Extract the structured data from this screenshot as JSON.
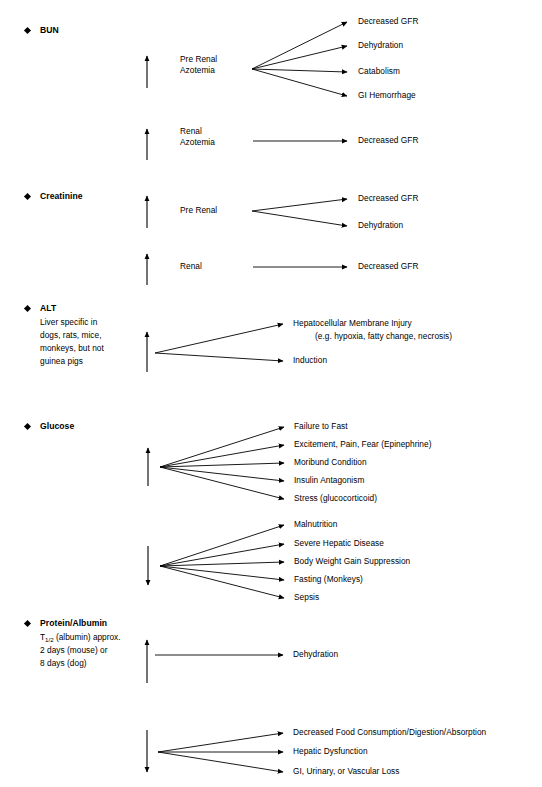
{
  "document": {
    "title": "Clinical Pathology Parameter Change Causes",
    "bullet_icon": "diamond-bullet",
    "up_arrow_icon": "arrow-up-icon",
    "down_arrow_icon": "arrow-down-icon",
    "connector_icon": "arrow-right-connector",
    "ink_color": "#000000",
    "background_color": "#ffffff"
  },
  "sections": [
    {
      "id": "bun",
      "label": "BUN",
      "note_lines": [],
      "groups": [
        {
          "id": "bun-prerenal",
          "direction": "up",
          "mediator_lines": [
            "Pre Renal",
            "Azotemia"
          ],
          "causes": [
            "Decreased GFR",
            "Dehydration",
            "Catabolism",
            "GI Hemorrhage"
          ]
        },
        {
          "id": "bun-renal",
          "direction": "up",
          "mediator_lines": [
            "Renal",
            "Azotemia"
          ],
          "causes": [
            "Decreased GFR"
          ]
        }
      ]
    },
    {
      "id": "creatinine",
      "label": "Creatinine",
      "note_lines": [],
      "groups": [
        {
          "id": "creatinine-prerenal",
          "direction": "up",
          "mediator_lines": [
            "Pre Renal"
          ],
          "causes": [
            "Decreased GFR",
            "Dehydration"
          ]
        },
        {
          "id": "creatinine-renal",
          "direction": "up",
          "mediator_lines": [
            "Renal"
          ],
          "causes": [
            "Decreased GFR"
          ]
        }
      ]
    },
    {
      "id": "alt",
      "label": "ALT",
      "note_lines": [
        "Liver specific in",
        "dogs, rats, mice,",
        "monkeys, but not",
        "guinea pigs"
      ],
      "groups": [
        {
          "id": "alt-increase",
          "direction": "up",
          "mediator_lines": [],
          "causes": [
            "Hepatocellular Membrane Injury",
            "Induction"
          ],
          "sub_causes": [
            "(e.g. hypoxia, fatty change, necrosis)"
          ]
        }
      ]
    },
    {
      "id": "glucose",
      "label": "Glucose",
      "note_lines": [],
      "groups": [
        {
          "id": "glucose-increase",
          "direction": "up",
          "mediator_lines": [],
          "causes": [
            "Failure to Fast",
            "Excitement, Pain, Fear (Epinephrine)",
            "Moribund Condition",
            "Insulin Antagonism",
            "Stress (glucocorticoid)"
          ]
        },
        {
          "id": "glucose-decrease",
          "direction": "down",
          "mediator_lines": [],
          "causes": [
            "Malnutrition",
            "Severe Hepatic Disease",
            "Body Weight Gain Suppression",
            "Fasting (Monkeys)",
            "Sepsis"
          ]
        }
      ]
    },
    {
      "id": "protein-albumin",
      "label": "Protein/Albumin",
      "note_lines": [
        "T1/2 (albumin) approx.",
        "2 days (mouse) or",
        "8 days (dog)"
      ],
      "groups": [
        {
          "id": "protein-increase",
          "direction": "up",
          "mediator_lines": [],
          "causes": [
            "Dehydration"
          ]
        },
        {
          "id": "protein-decrease",
          "direction": "down",
          "mediator_lines": [],
          "causes": [
            "Decreased Food Consumption/Digestion/Absorption",
            "Hepatic Dysfunction",
            "GI, Urinary, or Vascular Loss"
          ]
        }
      ]
    }
  ],
  "labels": {
    "bun_heading": "BUN",
    "creatinine_heading": "Creatinine",
    "alt_heading": "ALT",
    "glucose_heading": "Glucose",
    "protein_heading": "Protein/Albumin",
    "alt_note_1": "Liver specific in",
    "alt_note_2": "dogs, rats, mice,",
    "alt_note_3": "monkeys, but not",
    "alt_note_4": "guinea pigs",
    "protein_note_1_pre": "T",
    "protein_note_1_sub": "1/2",
    "protein_note_1_post": " (albumin) approx.",
    "protein_note_2": "2 days (mouse) or",
    "protein_note_3": "8 days (dog)",
    "bun_prerenal_1": "Pre Renal",
    "bun_prerenal_2": "Azotemia",
    "bun_renal_1": "Renal",
    "bun_renal_2": "Azotemia",
    "creat_prerenal": "Pre Renal",
    "creat_renal": "Renal",
    "bun_cause_1": "Decreased GFR",
    "bun_cause_2": "Dehydration",
    "bun_cause_3": "Catabolism",
    "bun_cause_4": "GI Hemorrhage",
    "bun_renal_cause_1": "Decreased GFR",
    "creat_prerenal_cause_1": "Decreased GFR",
    "creat_prerenal_cause_2": "Dehydration",
    "creat_renal_cause_1": "Decreased GFR",
    "alt_cause_1": "Hepatocellular Membrane Injury",
    "alt_cause_1_sub": "(e.g. hypoxia, fatty change, necrosis)",
    "alt_cause_2": "Induction",
    "glu_up_1": "Failure to Fast",
    "glu_up_2": "Excitement, Pain, Fear (Epinephrine)",
    "glu_up_3": "Moribund Condition",
    "glu_up_4": "Insulin Antagonism",
    "glu_up_5": "Stress (glucocorticoid)",
    "glu_dn_1": "Malnutrition",
    "glu_dn_2": "Severe Hepatic Disease",
    "glu_dn_3": "Body Weight Gain Suppression",
    "glu_dn_4": "Fasting (Monkeys)",
    "glu_dn_5": "Sepsis",
    "prot_up_1": "Dehydration",
    "prot_dn_1": "Decreased Food Consumption/Digestion/Absorption",
    "prot_dn_2": "Hepatic Dysfunction",
    "prot_dn_3": "GI, Urinary, or Vascular Loss"
  }
}
